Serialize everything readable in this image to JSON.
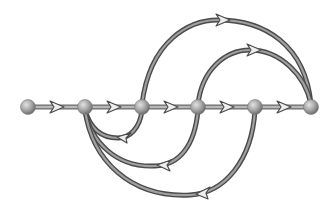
{
  "diagram": {
    "type": "signal-flow-graph",
    "colors": {
      "background": "#ffffff",
      "edge_outer": "#4a4a4a",
      "edge_inner": "#9a9a9a",
      "arrow_fill": "#e6e6e6",
      "arrow_stroke": "#4a4a4a",
      "node_light": "#d8d8d8",
      "node_dark": "#7a7a7a"
    },
    "nodes": [
      {
        "id": "n1",
        "x": 28,
        "y": 107
      },
      {
        "id": "n2",
        "x": 85,
        "y": 107
      },
      {
        "id": "n3",
        "x": 142,
        "y": 107
      },
      {
        "id": "n4",
        "x": 198,
        "y": 107
      },
      {
        "id": "n5",
        "x": 255,
        "y": 107
      },
      {
        "id": "n6",
        "x": 311,
        "y": 107
      }
    ],
    "edges": [
      {
        "id": "e12",
        "from": "n1",
        "to": "n2",
        "kind": "forward"
      },
      {
        "id": "e23",
        "from": "n2",
        "to": "n3",
        "kind": "forward"
      },
      {
        "id": "e34",
        "from": "n3",
        "to": "n4",
        "kind": "forward"
      },
      {
        "id": "e45",
        "from": "n4",
        "to": "n5",
        "kind": "forward"
      },
      {
        "id": "e56",
        "from": "n5",
        "to": "n6",
        "kind": "forward"
      },
      {
        "id": "e36",
        "from": "n3",
        "to": "n6",
        "kind": "feedforward-arc-above"
      },
      {
        "id": "e46",
        "from": "n4",
        "to": "n6",
        "kind": "feedforward-arc-above"
      },
      {
        "id": "e32",
        "from": "n3",
        "to": "n2",
        "kind": "feedback-arc-below"
      },
      {
        "id": "e42",
        "from": "n4",
        "to": "n2",
        "kind": "feedback-arc-below"
      },
      {
        "id": "e52",
        "from": "n5",
        "to": "n2",
        "kind": "feedback-arc-below"
      }
    ]
  }
}
